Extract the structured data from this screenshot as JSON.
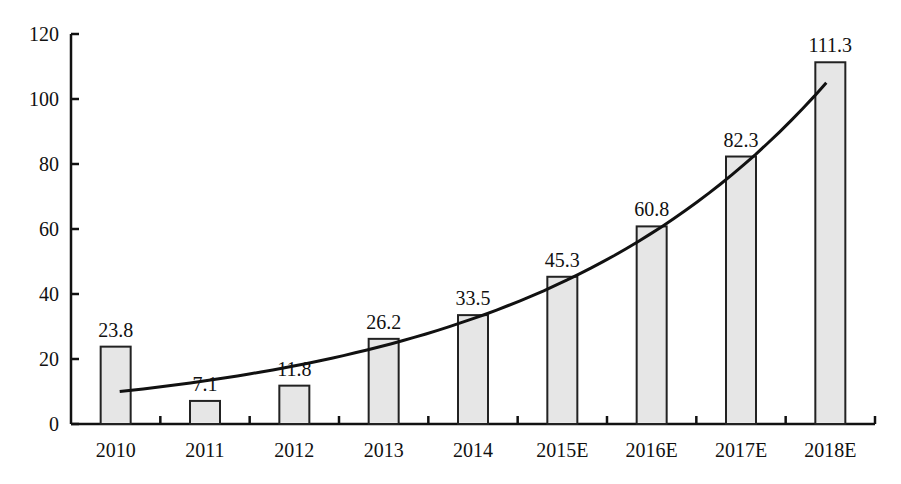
{
  "chart_data": {
    "type": "bar",
    "title": "",
    "xlabel": "",
    "ylabel": "",
    "categories": [
      "2010",
      "2011",
      "2012",
      "2013",
      "2014",
      "2015E",
      "2016E",
      "2017E",
      "2018E"
    ],
    "values": [
      23.8,
      7.1,
      11.8,
      26.2,
      33.5,
      45.3,
      60.8,
      82.3,
      111.3
    ],
    "value_labels": [
      "23.8",
      "7.1",
      "11.8",
      "26.2",
      "33.5",
      "45.3",
      "60.8",
      "82.3",
      "111.3"
    ],
    "ylim": [
      0,
      120
    ],
    "yticks": [
      0,
      20,
      40,
      60,
      80,
      100,
      120
    ],
    "grid": false,
    "legend": null,
    "bar_fill": "#e6e6e6",
    "bar_stroke": "#222222",
    "trendline": {
      "type": "exponential",
      "start": {
        "category": "2010",
        "value": 10
      },
      "end": {
        "category": "2018E",
        "value": 105
      }
    }
  }
}
